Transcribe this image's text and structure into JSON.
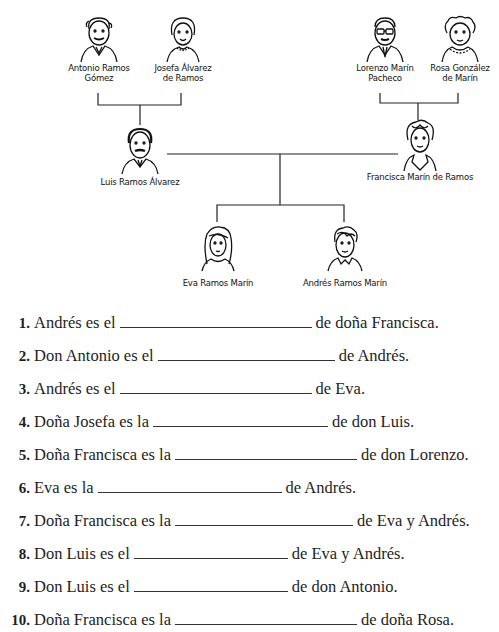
{
  "page": {
    "partial_header_text": "…g… … y…, …p…"
  },
  "family_tree": {
    "grandparents_paternal": [
      {
        "name_line1": "Antonio Ramos",
        "name_line2": "Gómez"
      },
      {
        "name_line1": "Josefa Álvarez",
        "name_line2": "de Ramos"
      }
    ],
    "grandparents_maternal": [
      {
        "name_line1": "Lorenzo Marín",
        "name_line2": "Pacheco"
      },
      {
        "name_line1": "Rosa González",
        "name_line2": "de Marín"
      }
    ],
    "parents": [
      {
        "name": "Luis Ramos Álvarez"
      },
      {
        "name": "Francisca Marín de Ramos"
      }
    ],
    "children": [
      {
        "name": "Eva Ramos Marín"
      },
      {
        "name": "Andrés Ramos Marín"
      }
    ]
  },
  "exercises": [
    {
      "number": "1.",
      "before": "Andrés es el",
      "after": "de doña Francisca.",
      "answer": ""
    },
    {
      "number": "2.",
      "before": "Don Antonio es el",
      "after": "de Andrés.",
      "answer": ""
    },
    {
      "number": "3.",
      "before": "Andrés es el",
      "after": "de Eva.",
      "answer": ""
    },
    {
      "number": "4.",
      "before": "Doña Josefa es la",
      "after": "de don Luis.",
      "answer": ""
    },
    {
      "number": "5.",
      "before": "Doña Francisca es la",
      "after": "de don Lorenzo.",
      "answer": ""
    },
    {
      "number": "6.",
      "before": "Eva es la",
      "after": "de Andrés.",
      "answer": ""
    },
    {
      "number": "7.",
      "before": "Doña Francisca es la",
      "after": "de Eva y Andrés.",
      "answer": ""
    },
    {
      "number": "8.",
      "before": "Don Luis es el",
      "after": "de Eva y Andrés.",
      "answer": ""
    },
    {
      "number": "9.",
      "before": "Don Luis es el",
      "after": "de don Antonio.",
      "answer": ""
    },
    {
      "number": "10.",
      "before": "Doña Francisca es la",
      "after": "de doña Rosa.",
      "answer": ""
    }
  ]
}
